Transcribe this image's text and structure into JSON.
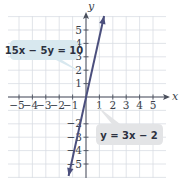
{
  "chart_data": {
    "type": "line",
    "title": "",
    "xlabel": "x",
    "ylabel": "y",
    "xlim": [
      -5.5,
      5.8
    ],
    "ylim": [
      -6,
      6.2
    ],
    "grid": true,
    "x_ticks": [
      -5,
      -4,
      -3,
      -2,
      -1,
      1,
      2,
      3,
      4,
      5
    ],
    "y_ticks": [
      5,
      4,
      3,
      2,
      1,
      -2,
      -3,
      -4,
      -5
    ],
    "x_tick_labels": [
      "−5",
      "−4",
      "−3",
      "−2",
      "−1",
      "1",
      "2",
      "3",
      "4",
      "5"
    ],
    "y_tick_labels": [
      "5",
      "4",
      "3",
      "2",
      "1",
      "−2",
      "−3",
      "−4",
      "−5"
    ],
    "series": [
      {
        "name": "y = 3x − 2",
        "equivalent_form": "15x − 5y = 10",
        "slope": 3,
        "intercept": -2,
        "x": [
          -1.3,
          1.35
        ],
        "y": [
          -5.9,
          6.05
        ],
        "color": "#4b4f7d",
        "arrows": "both"
      }
    ],
    "annotations": [
      {
        "text": "15x − 5y = 10",
        "box_color": "#d8e8ef",
        "points_to": [
          0,
          1.9
        ]
      },
      {
        "text": "y = 3x − 2",
        "box_color": "#e3e4e6",
        "points_to": [
          0.8,
          0.5
        ]
      }
    ]
  },
  "labels": {
    "x_axis": "x",
    "y_axis": "y",
    "eq1": "15x − 5y = 10",
    "eq2": "y = 3x − 2"
  },
  "colors": {
    "grid": "#d9dde3",
    "axis": "#4a4f5c",
    "line": "#4b4f7d",
    "label1_bg": "#d8e8ef",
    "label2_bg": "#e3e4e6"
  }
}
